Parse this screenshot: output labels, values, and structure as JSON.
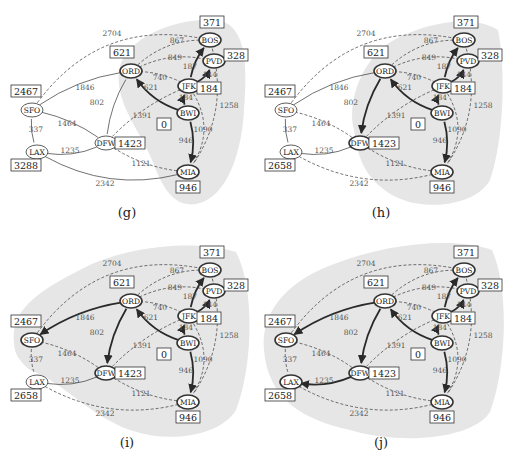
{
  "figure": {
    "source_node": "BWI",
    "colors": {
      "shade": "#e6e6e6",
      "edge": "#333333",
      "tree_edge": "#2a2a2a",
      "label": "#555555",
      "box_border": "#333333"
    },
    "nodes": [
      {
        "id": "SFO",
        "x": 32,
        "y": 110
      },
      {
        "id": "LAX",
        "x": 37,
        "y": 152
      },
      {
        "id": "DFW",
        "x": 106,
        "y": 143
      },
      {
        "id": "ORD",
        "x": 131,
        "y": 71
      },
      {
        "id": "BOS",
        "x": 210,
        "y": 40
      },
      {
        "id": "PVD",
        "x": 214,
        "y": 61
      },
      {
        "id": "JFK",
        "x": 189,
        "y": 86
      },
      {
        "id": "BWI",
        "x": 188,
        "y": 113
      },
      {
        "id": "MIA",
        "x": 188,
        "y": 172
      }
    ],
    "edges": [
      {
        "a": "SFO",
        "b": "BOS",
        "w": "2704",
        "lx": 112,
        "ly": 36
      },
      {
        "a": "SFO",
        "b": "ORD",
        "w": "1846",
        "lx": 85,
        "ly": 90
      },
      {
        "a": "SFO",
        "b": "LAX",
        "w": "337",
        "lx": 36,
        "ly": 132
      },
      {
        "a": "SFO",
        "b": "DFW",
        "w": "1464",
        "lx": 67,
        "ly": 126
      },
      {
        "a": "LAX",
        "b": "DFW",
        "w": "1235",
        "lx": 70,
        "ly": 153
      },
      {
        "a": "LAX",
        "b": "MIA",
        "w": "2342",
        "lx": 105,
        "ly": 186
      },
      {
        "a": "DFW",
        "b": "ORD",
        "w": "802",
        "lx": 97,
        "ly": 105
      },
      {
        "a": "DFW",
        "b": "JFK",
        "w": "1391",
        "lx": 142,
        "ly": 118
      },
      {
        "a": "DFW",
        "b": "MIA",
        "w": "1121",
        "lx": 141,
        "ly": 166
      },
      {
        "a": "ORD",
        "b": "BOS",
        "w": "867",
        "lx": 177,
        "ly": 43
      },
      {
        "a": "ORD",
        "b": "PVD",
        "w": "849",
        "lx": 175,
        "ly": 60
      },
      {
        "a": "ORD",
        "b": "JFK",
        "w": "740",
        "lx": 160,
        "ly": 80
      },
      {
        "a": "ORD",
        "b": "BWI",
        "w": "621",
        "lx": 151,
        "ly": 90
      },
      {
        "a": "JFK",
        "b": "BOS",
        "w": "187",
        "lx": 190,
        "ly": 69
      },
      {
        "a": "JFK",
        "b": "PVD",
        "w": "144",
        "lx": 210,
        "ly": 77
      },
      {
        "a": "JFK",
        "b": "BWI",
        "w": "184",
        "lx": 186,
        "ly": 100
      },
      {
        "a": "JFK",
        "b": "MIA",
        "w": "1090",
        "lx": 203,
        "ly": 132
      },
      {
        "a": "BWI",
        "b": "MIA",
        "w": "946",
        "lx": 186,
        "ly": 143
      },
      {
        "a": "BOS",
        "b": "MIA",
        "w": "1258",
        "lx": 229,
        "ly": 108
      }
    ],
    "panels": [
      {
        "id": "g",
        "caption": "(g)",
        "distances": {
          "BOS": "371",
          "PVD": "328",
          "ORD": "621",
          "JFK": "184",
          "SFO": "2467",
          "BWI": "0",
          "DFW": "1423",
          "LAX": "3288",
          "MIA": "946"
        },
        "tree_edges": [
          [
            "BWI",
            "ORD"
          ],
          [
            "BWI",
            "JFK"
          ],
          [
            "JFK",
            "BOS"
          ],
          [
            "JFK",
            "PVD"
          ],
          [
            "BWI",
            "MIA"
          ]
        ],
        "solid_edges": [
          "SFO-ORD",
          "SFO-LAX",
          "SFO-DFW",
          "LAX-DFW",
          "LAX-MIA",
          "DFW-ORD"
        ],
        "visited": [
          "BWI",
          "JFK",
          "PVD",
          "BOS",
          "ORD",
          "MIA"
        ]
      },
      {
        "id": "h",
        "caption": "(h)",
        "distances": {
          "BOS": "371",
          "PVD": "328",
          "ORD": "621",
          "JFK": "184",
          "SFO": "2467",
          "BWI": "0",
          "DFW": "1423",
          "LAX": "2658",
          "MIA": "946"
        },
        "tree_edges": [
          [
            "BWI",
            "ORD"
          ],
          [
            "BWI",
            "JFK"
          ],
          [
            "JFK",
            "BOS"
          ],
          [
            "JFK",
            "PVD"
          ],
          [
            "BWI",
            "MIA"
          ],
          [
            "ORD",
            "DFW"
          ]
        ],
        "solid_edges": [
          "SFO-ORD",
          "SFO-LAX",
          "LAX-DFW"
        ],
        "visited": [
          "BWI",
          "JFK",
          "PVD",
          "BOS",
          "ORD",
          "MIA",
          "DFW"
        ]
      },
      {
        "id": "i",
        "caption": "(i)",
        "distances": {
          "BOS": "371",
          "PVD": "328",
          "ORD": "621",
          "JFK": "184",
          "SFO": "2467",
          "BWI": "0",
          "DFW": "1423",
          "LAX": "2658",
          "MIA": "946"
        },
        "tree_edges": [
          [
            "BWI",
            "ORD"
          ],
          [
            "BWI",
            "JFK"
          ],
          [
            "JFK",
            "BOS"
          ],
          [
            "JFK",
            "PVD"
          ],
          [
            "BWI",
            "MIA"
          ],
          [
            "ORD",
            "DFW"
          ],
          [
            "ORD",
            "SFO"
          ]
        ],
        "solid_edges": [
          "LAX-DFW"
        ],
        "visited": [
          "BWI",
          "JFK",
          "PVD",
          "BOS",
          "ORD",
          "MIA",
          "DFW",
          "SFO"
        ]
      },
      {
        "id": "j",
        "caption": "(j)",
        "distances": {
          "BOS": "371",
          "PVD": "328",
          "ORD": "621",
          "JFK": "184",
          "SFO": "2467",
          "BWI": "0",
          "DFW": "1423",
          "LAX": "2658",
          "MIA": "946"
        },
        "tree_edges": [
          [
            "BWI",
            "ORD"
          ],
          [
            "BWI",
            "JFK"
          ],
          [
            "JFK",
            "BOS"
          ],
          [
            "JFK",
            "PVD"
          ],
          [
            "BWI",
            "MIA"
          ],
          [
            "ORD",
            "DFW"
          ],
          [
            "ORD",
            "SFO"
          ],
          [
            "DFW",
            "LAX"
          ]
        ],
        "solid_edges": [],
        "visited": [
          "BWI",
          "JFK",
          "PVD",
          "BOS",
          "ORD",
          "MIA",
          "DFW",
          "SFO",
          "LAX"
        ]
      }
    ],
    "distance_boxes": {
      "BOS": {
        "x": 212,
        "y": 22
      },
      "PVD": {
        "x": 236,
        "y": 55
      },
      "ORD": {
        "x": 122,
        "y": 52
      },
      "JFK": {
        "x": 209,
        "y": 88
      },
      "SFO": {
        "x": 26,
        "y": 91
      },
      "BWI": {
        "x": 164,
        "y": 124
      },
      "DFW": {
        "x": 130,
        "y": 143
      },
      "LAX": {
        "x": 26,
        "y": 165
      },
      "MIA": {
        "x": 188,
        "y": 187
      }
    }
  }
}
